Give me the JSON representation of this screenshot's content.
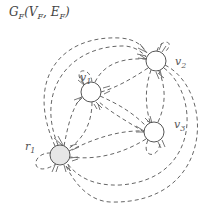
{
  "diagram": {
    "title_parts": {
      "G": "G",
      "sub_F": "F",
      "open": "(V",
      "sub_VF": "F",
      "comma": ", E",
      "sub_EF": "F",
      "close": ")"
    },
    "nodes": [
      {
        "id": "v1",
        "label_main": "v",
        "label_sub": "1",
        "cx": 91,
        "cy": 92,
        "r": 10,
        "fill": "#ffffff"
      },
      {
        "id": "v2",
        "label_main": "v",
        "label_sub": "2",
        "cx": 156,
        "cy": 61,
        "r": 10,
        "fill": "#ffffff"
      },
      {
        "id": "v3",
        "label_main": "v",
        "label_sub": "3",
        "cx": 154,
        "cy": 132,
        "r": 10,
        "fill": "#ffffff"
      },
      {
        "id": "r1",
        "label_main": "r",
        "label_sub": "1",
        "cx": 60,
        "cy": 155,
        "r": 10,
        "fill": "#e6e6e6"
      }
    ],
    "edge_style": {
      "stroke": "#666666",
      "dash": "dashed",
      "arrowheads": "multiple chevrons at target"
    },
    "edges_description": "Complete multi-digraph: each node has dashed directed edges to every other node, plus self-loops on v1, v2, v3, r1"
  }
}
